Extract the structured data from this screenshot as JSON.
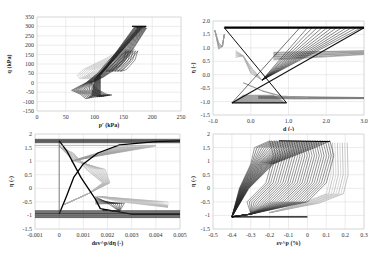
{
  "chart_data": [
    {
      "id": "p-q",
      "type": "line",
      "title": "",
      "xlabel": "p' (kPa)",
      "ylabel": "q (kPa)",
      "xlim": [
        0,
        250
      ],
      "ylim": [
        -150,
        350
      ],
      "xticks": [
        0,
        50,
        100,
        150,
        200,
        250
      ],
      "yticks": [
        350,
        300,
        250,
        200,
        150,
        100,
        50,
        0,
        -50,
        -100,
        -150
      ],
      "grid": true,
      "legend": "none",
      "description": "Stress path loops in p'-q space; cycles between roughly p'=60-190 kPa and q=-50 to 300 kPa",
      "series": [
        {
          "name": "cycles",
          "points": [
            [
              60,
              -40
            ],
            [
              75,
              -50
            ],
            [
              100,
              -90
            ],
            [
              110,
              -80
            ],
            [
              105,
              60
            ],
            [
              115,
              100
            ],
            [
              170,
              300
            ],
            [
              185,
              300
            ],
            [
              190,
              290
            ],
            [
              150,
              200
            ],
            [
              120,
              100
            ],
            [
              95,
              20
            ],
            [
              85,
              -30
            ],
            [
              70,
              -45
            ],
            [
              60,
              -40
            ]
          ]
        }
      ]
    },
    {
      "id": "d-eta",
      "type": "line",
      "title": "",
      "xlabel": "d (-)",
      "ylabel": "η (-)",
      "xlim": [
        -1.0,
        3.0
      ],
      "ylim": [
        -1.5,
        2.0
      ],
      "xticks": [
        -1.0,
        0.0,
        1.0,
        2.0,
        3.0
      ],
      "yticks": [
        2.0,
        1.5,
        1.0,
        0.5,
        0.0,
        -0.5,
        -1.0,
        -1.5
      ],
      "grid": true,
      "legend": "none",
      "description": "Dilatancy d versus stress ratio η; fan of lines from (0.3,-0.2) to upper bound at η≈1.75, horizontal bands at η≈1.75 and η≈-1.05",
      "series": [
        {
          "name": "upper-band",
          "points": [
            [
              -0.7,
              1.75
            ],
            [
              3.0,
              1.75
            ]
          ]
        },
        {
          "name": "lower-triangle",
          "points": [
            [
              -0.5,
              -1.05
            ],
            [
              0.95,
              -1.05
            ],
            [
              -0.7,
              1.75
            ]
          ]
        },
        {
          "name": "fan-outer",
          "points": [
            [
              -0.5,
              -1.05
            ],
            [
              3.0,
              1.75
            ]
          ]
        }
      ]
    },
    {
      "id": "deps-eta",
      "type": "line",
      "title": "",
      "xlabel": "dεv^p/dη (-)",
      "ylabel": "η (-)",
      "xlim": [
        -0.001,
        0.005
      ],
      "ylim": [
        -1.5,
        2.0
      ],
      "xticks": [
        -0.001,
        0,
        0.001,
        0.002,
        0.003,
        0.004,
        0.005
      ],
      "yticks": [
        2.0,
        1.5,
        1.0,
        0.5,
        0.0,
        -0.5,
        -1.0,
        -1.5
      ],
      "grid": true,
      "legend": "none",
      "description": "Plastic volumetric strain increment ratio versus η; bands at η≈1.75 and η≈-0.9 to -1.05; crossing S-curves around 0.0005",
      "series": [
        {
          "name": "upper-band",
          "points": [
            [
              -0.001,
              1.75
            ],
            [
              0.005,
              1.75
            ]
          ]
        },
        {
          "name": "lower-band",
          "points": [
            [
              -0.001,
              -1.0
            ],
            [
              0.005,
              -1.0
            ]
          ]
        }
      ]
    },
    {
      "id": "epsv-eta",
      "type": "line",
      "title": "",
      "xlabel": "εv^p (%)",
      "ylabel": "η (-)",
      "xlim": [
        -0.5,
        0.3
      ],
      "ylim": [
        -1.5,
        2.0
      ],
      "xticks": [
        -0.5,
        -0.4,
        -0.3,
        -0.2,
        -0.1,
        0,
        0.1,
        0.2,
        0.3
      ],
      "yticks": [
        2.0,
        1.5,
        1.0,
        0.5,
        0.0,
        -0.5,
        -1.0,
        -1.5
      ],
      "grid": true,
      "legend": "none",
      "description": "Plastic volumetric strain versus η; many hysteresis loops between εv^p ≈ -0.4 and 0.22 %, η from -1.05 to 1.75",
      "series": [
        {
          "name": "envelope",
          "points": [
            [
              -0.4,
              -1.05
            ],
            [
              -0.3,
              0.6
            ],
            [
              -0.15,
              1.5
            ],
            [
              -0.1,
              1.75
            ],
            [
              0.1,
              1.7
            ],
            [
              0.22,
              1.65
            ],
            [
              0.22,
              -0.2
            ],
            [
              0.0,
              -0.5
            ],
            [
              -0.2,
              -0.9
            ],
            [
              -0.4,
              -1.05
            ]
          ]
        }
      ]
    }
  ]
}
